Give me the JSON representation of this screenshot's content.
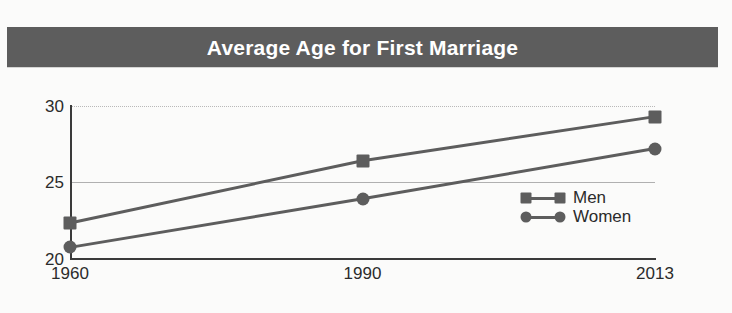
{
  "banner": {
    "title": "Average Age for First Marriage",
    "background_color": "#5d5d5d",
    "text_color": "#ffffff"
  },
  "legend": {
    "position": "inside-right",
    "entries": [
      {
        "label": "Men",
        "marker": "square-marker"
      },
      {
        "label": "Women",
        "marker": "circle-marker"
      }
    ]
  },
  "axes": {
    "y_ticks": [
      "30",
      "25",
      "20"
    ],
    "x_ticks": [
      "1960",
      "1990",
      "2013"
    ]
  },
  "chart_data": {
    "type": "line",
    "title": "Average Age for First Marriage",
    "xlabel": "",
    "ylabel": "",
    "categories": [
      "1960",
      "1990",
      "2013"
    ],
    "x": [
      1960,
      1990,
      2013
    ],
    "series": [
      {
        "name": "Men",
        "marker": "square",
        "color": "#5d5d5d",
        "values": [
          22.3,
          26.4,
          29.3
        ]
      },
      {
        "name": "Women",
        "marker": "circle",
        "color": "#5d5d5d",
        "values": [
          20.7,
          23.9,
          27.2
        ]
      }
    ],
    "ylim": [
      20,
      30
    ],
    "y_tick_values": [
      20,
      25,
      30
    ],
    "grid": "horizontal",
    "legend_position": "inside-right",
    "annotations": []
  }
}
